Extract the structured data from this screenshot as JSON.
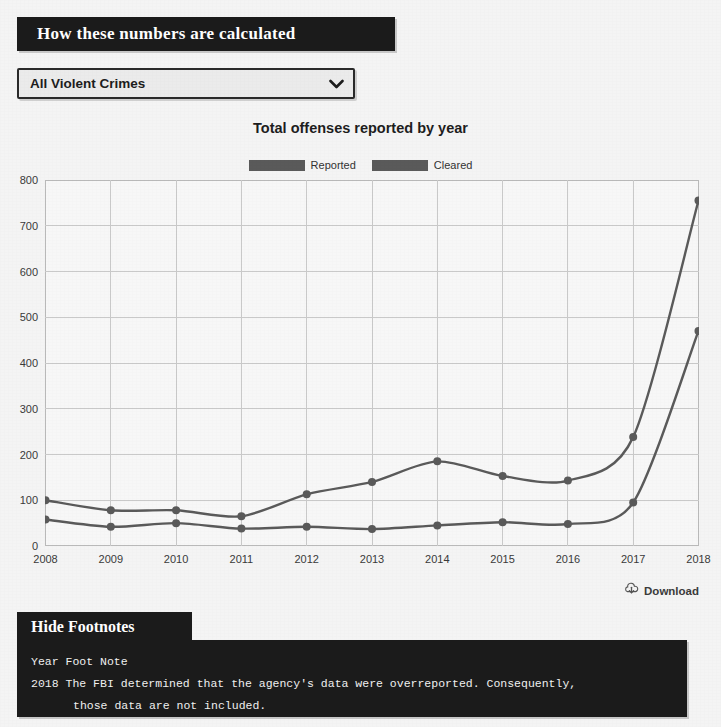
{
  "header": {
    "calc_banner_label": "How these numbers are calculated"
  },
  "filter": {
    "select_value": "All Violent Crimes",
    "chevron_icon": "chevron-down-icon"
  },
  "chart_data": {
    "type": "line",
    "title": "Total offenses reported by year",
    "xlabel": "",
    "ylabel": "",
    "categories": [
      "2008",
      "2009",
      "2010",
      "2011",
      "2012",
      "2013",
      "2014",
      "2015",
      "2016",
      "2017",
      "2018"
    ],
    "series": [
      {
        "name": "Reported",
        "color": "#5a5a5a",
        "values": [
          100,
          78,
          78,
          65,
          113,
          140,
          185,
          153,
          143,
          238,
          755
        ]
      },
      {
        "name": "Cleared",
        "color": "#5a5a5a",
        "values": [
          58,
          42,
          50,
          38,
          42,
          37,
          45,
          52,
          48,
          95,
          470
        ]
      }
    ],
    "ylim": [
      0,
      800
    ],
    "yticks": [
      "0",
      "100",
      "200",
      "300",
      "400",
      "500",
      "600",
      "700",
      "800"
    ],
    "grid": true,
    "legend_position": "top"
  },
  "actions": {
    "download_label": "Download",
    "download_icon": "cloud-download-icon"
  },
  "footnotes": {
    "toggle_label": "Hide Footnotes",
    "col_year": "Year",
    "col_note": "Foot Note",
    "rows": [
      {
        "year": "2018",
        "note_line1": "The FBI determined that the agency's data were overreported. Consequently,",
        "note_line2": "those data are not included."
      }
    ]
  }
}
